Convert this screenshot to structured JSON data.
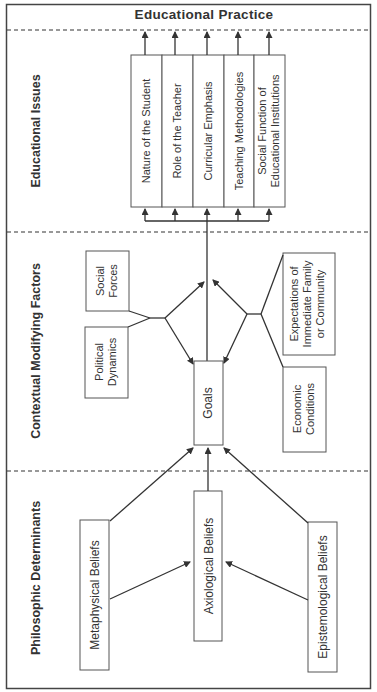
{
  "header": {
    "title": "Educational Practice"
  },
  "sections": {
    "issues": "Educational Issues",
    "contextual": "Contextual Modifying Factors",
    "philosophic": "Philosophic Determinants"
  },
  "issues": [
    {
      "lines": [
        "Nature of the Student"
      ]
    },
    {
      "lines": [
        "Role of the Teacher"
      ]
    },
    {
      "lines": [
        "Curricular Emphasis"
      ]
    },
    {
      "lines": [
        "Teaching Methodologies"
      ]
    },
    {
      "lines": [
        "Social Function of",
        "Educational Institutions"
      ]
    }
  ],
  "goals": {
    "label": "Goals"
  },
  "factors": {
    "social_forces": [
      "Social",
      "Forces"
    ],
    "political_dynamics": [
      "Political",
      "Dynamics"
    ],
    "expectations": [
      "Expectations of",
      "Immediate Family",
      "or Community"
    ],
    "economic_conditions": [
      "Economic",
      "Conditions"
    ]
  },
  "beliefs": {
    "metaphysical": "Metaphysical Beliefs",
    "axiological": "Axiological Beliefs",
    "epistemological": "Epistemological Beliefs"
  }
}
